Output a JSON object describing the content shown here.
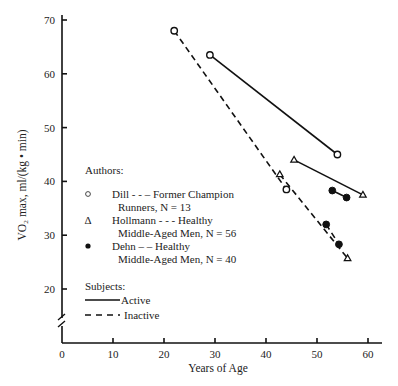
{
  "chart_data": {
    "type": "line",
    "title": "",
    "xlabel": "Years of Age",
    "ylabel": "VO₂ max, ml/(kg • min)",
    "xlim": [
      0,
      62
    ],
    "ylim": [
      10,
      70
    ],
    "x_ticks": [
      0,
      10,
      20,
      30,
      40,
      50,
      60
    ],
    "y_ticks": [
      20,
      30,
      40,
      50,
      60,
      70
    ],
    "grid": false,
    "y_axis_break": true,
    "series": [
      {
        "name": "Dill - Active",
        "author": "Dill",
        "subjects": "Active",
        "marker": "open-circle",
        "dash": "solid",
        "points": [
          {
            "x": 29,
            "y": 63.5
          },
          {
            "x": 54,
            "y": 45
          }
        ]
      },
      {
        "name": "Dill - Inactive",
        "author": "Dill",
        "subjects": "Inactive",
        "marker": "open-circle",
        "dash": "dashed",
        "points": [
          {
            "x": 22,
            "y": 68
          },
          {
            "x": 44,
            "y": 38.5
          }
        ]
      },
      {
        "name": "Hollmann - Active",
        "author": "Hollmann",
        "subjects": "Active",
        "marker": "open-triangle",
        "dash": "solid",
        "points": [
          {
            "x": 45.5,
            "y": 44
          },
          {
            "x": 59,
            "y": 37.5
          }
        ]
      },
      {
        "name": "Hollmann - Inactive",
        "author": "Hollmann",
        "subjects": "Inactive",
        "marker": "open-triangle",
        "dash": "dashed",
        "points": [
          {
            "x": 42.7,
            "y": 41.3
          },
          {
            "x": 56,
            "y": 25.7
          }
        ]
      },
      {
        "name": "Dehn - Active",
        "author": "Dehn",
        "subjects": "Active",
        "marker": "filled-circle",
        "dash": "solid",
        "points": [
          {
            "x": 53,
            "y": 38.3
          },
          {
            "x": 55.8,
            "y": 37
          }
        ]
      },
      {
        "name": "Dehn - Inactive",
        "author": "Dehn",
        "subjects": "Inactive",
        "marker": "filled-circle",
        "dash": "dashed",
        "points": [
          {
            "x": 51.8,
            "y": 32
          },
          {
            "x": 54.3,
            "y": 28.3
          }
        ]
      }
    ],
    "legend": {
      "authors_title": "Authors:",
      "authors": [
        {
          "symbol": "○",
          "line1": "Dill - - – Former Champion",
          "line2": "Runners, N = 13"
        },
        {
          "symbol": "Δ",
          "line1": "Hollmann - - - Healthy",
          "line2": "Middle-Aged Men, N = 56"
        },
        {
          "symbol": "●",
          "line1": "Dehn – – Healthy",
          "line2": "Middle-Aged Men, N = 40"
        }
      ],
      "subjects_title": "Subjects:",
      "subjects": [
        {
          "dash": "solid",
          "label": "Active"
        },
        {
          "dash": "dashed",
          "label": "Inactive"
        }
      ]
    }
  }
}
